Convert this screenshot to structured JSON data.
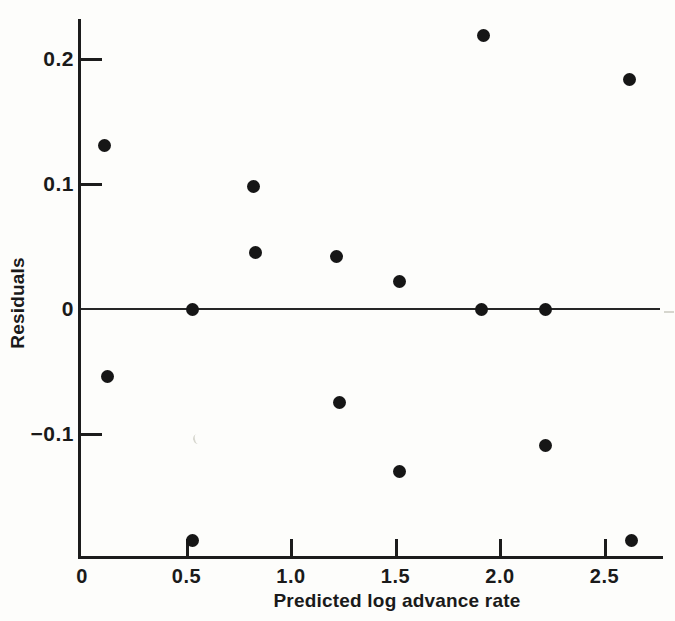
{
  "figure": {
    "background": "#fdfdfb",
    "ink_color": "#1a1a1a"
  },
  "chart_data": {
    "type": "scatter",
    "title": "",
    "xlabel": "Predicted log advance rate",
    "ylabel": "Residuals",
    "xlim": [
      0,
      2.78
    ],
    "ylim": [
      -0.2,
      0.232
    ],
    "grid": false,
    "legend": "none",
    "marker": "filled-black-circle",
    "zero_reference_line": 0,
    "x_ticks": [
      {
        "value": 0,
        "label": "0"
      },
      {
        "value": 0.5,
        "label": "0.5"
      },
      {
        "value": 1.0,
        "label": "1.0"
      },
      {
        "value": 1.5,
        "label": "1.5"
      },
      {
        "value": 2.0,
        "label": "2.0"
      },
      {
        "value": 2.5,
        "label": "2.5"
      }
    ],
    "y_ticks": [
      {
        "value": 0.2,
        "label": "0.2"
      },
      {
        "value": 0.1,
        "label": "0.1"
      },
      {
        "value": 0,
        "label": "0"
      },
      {
        "value": -0.1,
        "label": "−0.1"
      }
    ],
    "points": [
      {
        "x": 0.11,
        "y": 0.131
      },
      {
        "x": 0.12,
        "y": -0.054
      },
      {
        "x": 0.53,
        "y": 0.0
      },
      {
        "x": 0.53,
        "y": -0.185
      },
      {
        "x": 0.82,
        "y": 0.098
      },
      {
        "x": 0.83,
        "y": 0.045
      },
      {
        "x": 1.22,
        "y": 0.042
      },
      {
        "x": 1.23,
        "y": -0.075
      },
      {
        "x": 1.52,
        "y": 0.022
      },
      {
        "x": 1.52,
        "y": -0.13
      },
      {
        "x": 1.92,
        "y": 0.219
      },
      {
        "x": 1.91,
        "y": 0.0
      },
      {
        "x": 2.22,
        "y": 0.0
      },
      {
        "x": 2.22,
        "y": -0.109
      },
      {
        "x": 2.62,
        "y": 0.184
      },
      {
        "x": 2.63,
        "y": -0.185
      }
    ]
  },
  "artifacts": [
    {
      "type": "smudge-crescent",
      "x": 193,
      "y": 434
    },
    {
      "type": "smudge-dash",
      "x": 664,
      "y": 311
    }
  ]
}
